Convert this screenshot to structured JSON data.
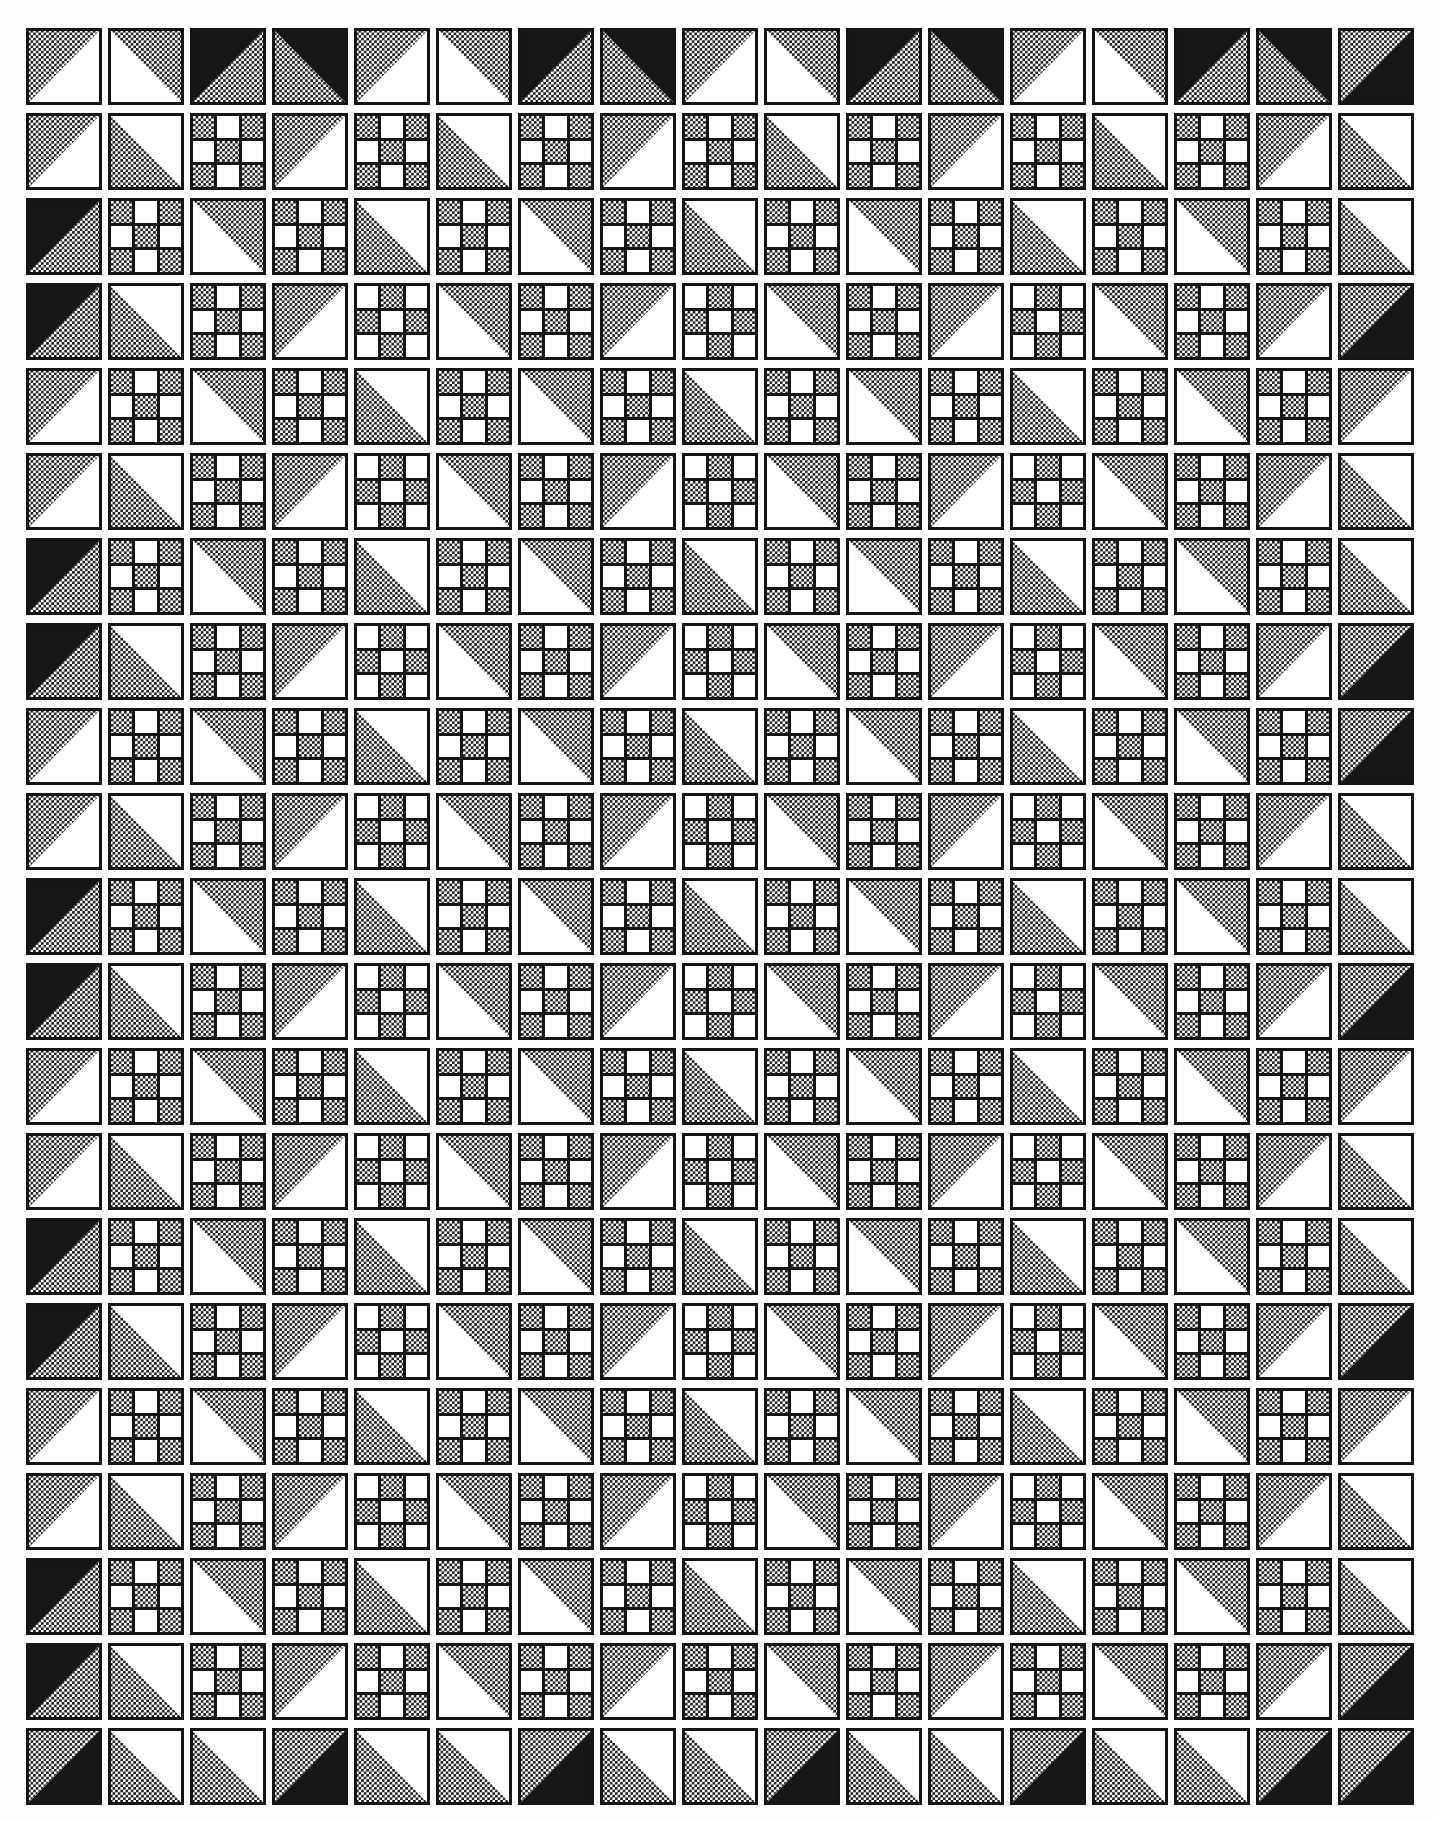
{
  "document": {
    "kind": "quilt-block-pattern-chart",
    "title": "",
    "caption": "",
    "page_background": "#fdfdfc",
    "ink_color": "#151515",
    "texture_color": "#1a1a1a",
    "blank_color": "#ffffff"
  },
  "grid": {
    "columns": 17,
    "rows": 21,
    "cell_width": 82,
    "cell_height": 85,
    "origin_x": 0,
    "origin_y": 0,
    "block_width": 76,
    "block_height": 77,
    "border_width": "3.2px"
  },
  "legend": {
    "block_types": [
      {
        "id": "triangle",
        "label": "Half-square triangle block"
      },
      {
        "id": "ninepatch",
        "label": "Nine-patch checkerboard block"
      }
    ],
    "fills": [
      {
        "id": "tex",
        "label": "Printed checker texture"
      },
      {
        "id": "solid",
        "label": "Solid dark fabric"
      },
      {
        "id": "blank",
        "label": "Plain light fabric"
      }
    ]
  },
  "chart_data": {
    "type": "table",
    "columns": 17,
    "rows": 21,
    "cells": [
      [
        "tri|tl|tex|blank",
        "tri|tr|tex|blank",
        "tri|tl|solid|tex",
        "tri|tr|solid|tex",
        "tri|tl|tex|blank",
        "tri|tr|tex|blank",
        "tri|tl|solid|tex",
        "tri|tr|solid|tex",
        "tri|tl|tex|blank",
        "tri|tr|tex|blank",
        "tri|tl|solid|tex",
        "tri|tr|solid|tex",
        "tri|tl|tex|blank",
        "tri|tr|tex|blank",
        "tri|tl|solid|tex",
        "tri|tr|solid|tex",
        "tri|tl|tex|solid"
      ],
      [
        "tri|tl|tex|blank",
        "tri|bl|tex|blank",
        "np|A",
        "tri|tl|tex|blank",
        "np|A",
        "tri|bl|tex|blank",
        "np|A",
        "tri|tl|tex|blank",
        "np|A",
        "tri|bl|tex|blank",
        "np|A",
        "tri|tl|tex|blank",
        "np|A",
        "tri|bl|tex|blank",
        "np|A",
        "tri|tl|tex|blank",
        "tri|tr|blank|tex"
      ],
      [
        "tri|tl|solid|tex",
        "np|A",
        "tri|tr|tex|blank",
        "np|A",
        "tri|bl|tex|blank",
        "np|A",
        "tri|tr|tex|blank",
        "np|A",
        "tri|bl|tex|blank",
        "np|A",
        "tri|tr|tex|blank",
        "np|A",
        "tri|bl|tex|blank",
        "np|A",
        "tri|tr|tex|blank",
        "np|A",
        "tri|bl|tex|blank"
      ],
      [
        "tri|tl|solid|tex",
        "tri|tr|blank|tex",
        "np|A",
        "tri|tl|tex|blank",
        "np|B",
        "tri|tr|tex|blank",
        "np|A",
        "tri|tl|tex|blank",
        "np|B",
        "tri|tr|tex|blank",
        "np|A",
        "tri|tl|tex|blank",
        "np|B",
        "tri|tr|tex|blank",
        "np|A",
        "tri|tl|tex|blank",
        "tri|tl|tex|solid"
      ],
      [
        "tri|tl|tex|blank",
        "np|A",
        "tri|tr|tex|blank",
        "np|A",
        "tri|bl|tex|blank",
        "np|A",
        "tri|tr|tex|blank",
        "np|A",
        "tri|bl|tex|blank",
        "np|A",
        "tri|tr|tex|blank",
        "np|A",
        "tri|bl|tex|blank",
        "np|A",
        "tri|tr|tex|blank",
        "np|A",
        "tri|tl|tex|blank"
      ],
      [
        "tri|tl|tex|blank",
        "tri|tr|blank|tex",
        "np|A",
        "tri|tl|tex|blank",
        "np|B",
        "tri|tr|tex|blank",
        "np|A",
        "tri|tl|tex|blank",
        "np|B",
        "tri|tr|tex|blank",
        "np|A",
        "tri|tl|tex|blank",
        "np|B",
        "tri|tr|tex|blank",
        "np|A",
        "tri|tl|tex|blank",
        "tri|tr|blank|tex"
      ],
      [
        "tri|tl|solid|tex",
        "np|A",
        "tri|tr|tex|blank",
        "np|A",
        "tri|bl|tex|blank",
        "np|A",
        "tri|tr|tex|blank",
        "np|A",
        "tri|bl|tex|blank",
        "np|A",
        "tri|tr|tex|blank",
        "np|A",
        "tri|bl|tex|blank",
        "np|A",
        "tri|tr|tex|blank",
        "np|A",
        "tri|bl|tex|blank"
      ],
      [
        "tri|tl|solid|tex",
        "tri|tr|blank|tex",
        "np|A",
        "tri|tl|tex|blank",
        "np|B",
        "tri|tr|tex|blank",
        "np|A",
        "tri|tl|tex|blank",
        "np|B",
        "tri|tr|tex|blank",
        "np|A",
        "tri|tl|tex|blank",
        "np|B",
        "tri|tr|tex|blank",
        "np|A",
        "tri|tl|tex|blank",
        "tri|tl|tex|solid"
      ],
      [
        "tri|tl|tex|blank",
        "np|A",
        "tri|tr|tex|blank",
        "np|A",
        "tri|bl|tex|blank",
        "np|A",
        "tri|tr|tex|blank",
        "np|A",
        "tri|bl|tex|blank",
        "np|A",
        "tri|tr|tex|blank",
        "np|A",
        "tri|bl|tex|blank",
        "np|A",
        "tri|tr|tex|blank",
        "np|A",
        "tri|tl|tex|solid"
      ],
      [
        "tri|tl|tex|blank",
        "tri|tr|blank|tex",
        "np|A",
        "tri|tl|tex|blank",
        "np|B",
        "tri|tr|tex|blank",
        "np|A",
        "tri|tl|tex|blank",
        "np|B",
        "tri|tr|tex|blank",
        "np|A",
        "tri|tl|tex|blank",
        "np|B",
        "tri|tr|tex|blank",
        "np|A",
        "tri|tl|tex|blank",
        "tri|tr|blank|tex"
      ],
      [
        "tri|tl|solid|tex",
        "np|A",
        "tri|tr|tex|blank",
        "np|A",
        "tri|bl|tex|blank",
        "np|A",
        "tri|tr|tex|blank",
        "np|A",
        "tri|bl|tex|blank",
        "np|A",
        "tri|tr|tex|blank",
        "np|A",
        "tri|bl|tex|blank",
        "np|A",
        "tri|tr|tex|blank",
        "np|A",
        "tri|bl|tex|blank"
      ],
      [
        "tri|tl|solid|tex",
        "tri|tr|blank|tex",
        "np|A",
        "tri|tl|tex|blank",
        "np|B",
        "tri|tr|tex|blank",
        "np|A",
        "tri|tl|tex|blank",
        "np|B",
        "tri|tr|tex|blank",
        "np|A",
        "tri|tl|tex|blank",
        "np|B",
        "tri|tr|tex|blank",
        "np|A",
        "tri|tl|tex|blank",
        "tri|tl|tex|solid"
      ],
      [
        "tri|tl|tex|blank",
        "np|A",
        "tri|tr|tex|blank",
        "np|A",
        "tri|bl|tex|blank",
        "np|A",
        "tri|tr|tex|blank",
        "np|A",
        "tri|bl|tex|blank",
        "np|A",
        "tri|tr|tex|blank",
        "np|A",
        "tri|bl|tex|blank",
        "np|A",
        "tri|tr|tex|blank",
        "np|A",
        "tri|tl|tex|blank"
      ],
      [
        "tri|tl|tex|blank",
        "tri|tr|blank|tex",
        "np|A",
        "tri|tl|tex|blank",
        "np|B",
        "tri|tr|tex|blank",
        "np|A",
        "tri|tl|tex|blank",
        "np|B",
        "tri|tr|tex|blank",
        "np|A",
        "tri|tl|tex|blank",
        "np|B",
        "tri|tr|tex|blank",
        "np|A",
        "tri|tl|tex|blank",
        "tri|tr|blank|tex"
      ],
      [
        "tri|tl|solid|tex",
        "np|A",
        "tri|tr|tex|blank",
        "np|A",
        "tri|bl|tex|blank",
        "np|A",
        "tri|tr|tex|blank",
        "np|A",
        "tri|bl|tex|blank",
        "np|A",
        "tri|tr|tex|blank",
        "np|A",
        "tri|bl|tex|blank",
        "np|A",
        "tri|tr|tex|blank",
        "np|A",
        "tri|bl|tex|blank"
      ],
      [
        "tri|tl|solid|tex",
        "tri|tr|blank|tex",
        "np|A",
        "tri|tl|tex|blank",
        "np|B",
        "tri|tr|tex|blank",
        "np|A",
        "tri|tl|tex|blank",
        "np|B",
        "tri|tr|tex|blank",
        "np|A",
        "tri|tl|tex|blank",
        "np|B",
        "tri|tr|tex|blank",
        "np|A",
        "tri|tl|tex|blank",
        "tri|tl|tex|solid"
      ],
      [
        "tri|tl|tex|blank",
        "np|A",
        "tri|tr|tex|blank",
        "np|A",
        "tri|bl|tex|blank",
        "np|A",
        "tri|tr|tex|blank",
        "np|A",
        "tri|bl|tex|blank",
        "np|A",
        "tri|tr|tex|blank",
        "np|A",
        "tri|bl|tex|blank",
        "np|A",
        "tri|tr|tex|blank",
        "np|A",
        "tri|tl|tex|blank"
      ],
      [
        "tri|tl|tex|blank",
        "tri|tr|blank|tex",
        "np|A",
        "tri|tl|tex|blank",
        "np|B",
        "tri|tr|tex|blank",
        "np|A",
        "tri|tl|tex|blank",
        "np|B",
        "tri|tr|tex|blank",
        "np|A",
        "tri|tl|tex|blank",
        "np|B",
        "tri|tr|tex|blank",
        "np|A",
        "tri|tl|tex|blank",
        "tri|tr|blank|tex"
      ],
      [
        "tri|tl|solid|tex",
        "np|A",
        "tri|tr|tex|blank",
        "np|A",
        "tri|bl|tex|blank",
        "np|A",
        "tri|tr|tex|blank",
        "np|A",
        "tri|bl|tex|blank",
        "np|A",
        "tri|tr|tex|blank",
        "np|A",
        "tri|bl|tex|blank",
        "np|A",
        "tri|tr|tex|blank",
        "np|A",
        "tri|bl|tex|blank"
      ],
      [
        "tri|tl|solid|tex",
        "tri|tr|blank|tex",
        "np|A",
        "tri|tl|tex|blank",
        "np|A",
        "tri|tr|tex|blank",
        "np|A",
        "tri|tl|tex|blank",
        "np|A",
        "tri|tr|tex|blank",
        "np|A",
        "tri|tl|tex|blank",
        "np|A",
        "tri|tr|tex|blank",
        "np|A",
        "tri|tl|tex|blank",
        "tri|tl|tex|solid"
      ],
      [
        "tri|tl|tex|solid",
        "tri|tr|blank|tex",
        "tri|bl|tex|blank",
        "tri|tl|tex|solid",
        "tri|tr|blank|tex",
        "tri|bl|tex|blank",
        "tri|tl|tex|solid",
        "tri|tr|blank|tex",
        "tri|bl|tex|blank",
        "tri|tl|tex|solid",
        "tri|tr|blank|tex",
        "tri|bl|tex|blank",
        "tri|tl|tex|solid",
        "tri|tr|blank|tex",
        "tri|bl|tex|blank",
        "tri|tl|tex|solid",
        "tri|tl|tex|solid"
      ]
    ],
    "ninepatch_definitions": {
      "A": [
        "tex",
        "blank",
        "tex",
        "blank",
        "tex",
        "blank",
        "tex",
        "blank",
        "tex"
      ],
      "B": [
        "blank",
        "tex",
        "blank",
        "tex",
        "blank",
        "tex",
        "blank",
        "tex",
        "blank"
      ]
    }
  }
}
